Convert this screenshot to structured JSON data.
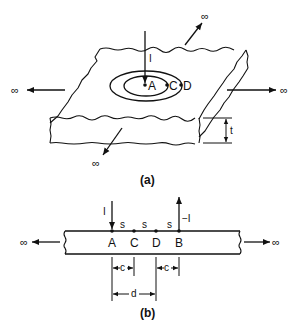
{
  "figure_a": {
    "caption": "(a)",
    "current_label": "I",
    "points": [
      "A",
      "C",
      "D"
    ],
    "thickness_label": "t",
    "infinity_symbols": [
      "∞",
      "∞",
      "∞",
      "∞"
    ]
  },
  "figure_b": {
    "caption": "(b)",
    "current_in_label": "I",
    "current_out_label": "−I",
    "points": [
      "A",
      "C",
      "D",
      "B"
    ],
    "spacing_labels": [
      "s",
      "s",
      "s"
    ],
    "dimension_c_left": "c",
    "dimension_c_right": "c",
    "dimension_d": "d",
    "infinity_left": "∞",
    "infinity_right": "∞"
  },
  "colors": {
    "ink": "#111111",
    "background": "#ffffff"
  }
}
